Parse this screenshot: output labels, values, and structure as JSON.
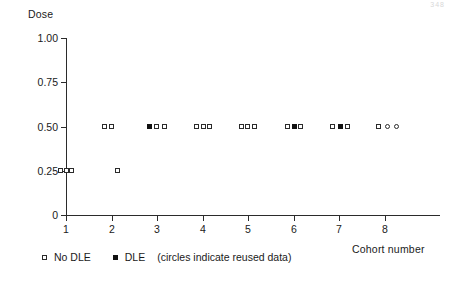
{
  "chart_data": {
    "type": "scatter",
    "title": "",
    "xlabel": "Cohort number",
    "ylabel": "Dose",
    "xlim": [
      0.55,
      8.75
    ],
    "ylim": [
      0,
      1.0
    ],
    "grid": false,
    "legend_position": "below-axes-left",
    "ytick_labels": [
      "1.00",
      "0.75",
      "0.50",
      "0.25",
      "0"
    ],
    "ytick_values": [
      1.0,
      0.75,
      0.5,
      0.25,
      0
    ],
    "xtick_labels": [
      "1",
      "2",
      "3",
      "4",
      "5",
      "6",
      "7",
      "8"
    ],
    "xtick_values": [
      1,
      2,
      3,
      4,
      5,
      6,
      7,
      8
    ],
    "series": [
      {
        "name": "No DLE",
        "marker": "square-open",
        "points": [
          {
            "x": 0.88,
            "y": 0.25
          },
          {
            "x": 1.0,
            "y": 0.25
          },
          {
            "x": 1.12,
            "y": 0.25
          },
          {
            "x": 2.14,
            "y": 0.25
          },
          {
            "x": 1.84,
            "y": 0.5
          },
          {
            "x": 1.99,
            "y": 0.5
          },
          {
            "x": 2.99,
            "y": 0.5
          },
          {
            "x": 3.16,
            "y": 0.5
          },
          {
            "x": 3.86,
            "y": 0.5
          },
          {
            "x": 4.02,
            "y": 0.5
          },
          {
            "x": 4.16,
            "y": 0.5
          },
          {
            "x": 4.85,
            "y": 0.5
          },
          {
            "x": 4.99,
            "y": 0.5
          },
          {
            "x": 5.15,
            "y": 0.5
          },
          {
            "x": 5.87,
            "y": 0.5
          },
          {
            "x": 6.16,
            "y": 0.5
          },
          {
            "x": 6.86,
            "y": 0.5
          },
          {
            "x": 7.18,
            "y": 0.5
          },
          {
            "x": 7.87,
            "y": 0.5
          }
        ]
      },
      {
        "name": "DLE",
        "marker": "square-filled",
        "points": [
          {
            "x": 2.83,
            "y": 0.5
          },
          {
            "x": 6.02,
            "y": 0.5
          },
          {
            "x": 7.04,
            "y": 0.5
          }
        ]
      },
      {
        "name": "reused data",
        "marker": "circle-open",
        "points": [
          {
            "x": 8.07,
            "y": 0.5
          },
          {
            "x": 8.26,
            "y": 0.5
          }
        ]
      }
    ]
  },
  "legend": {
    "no_dle_label": "No DLE",
    "dle_label": "DLE",
    "note": "(circles indicate reused data)"
  },
  "page_artifact": "348"
}
